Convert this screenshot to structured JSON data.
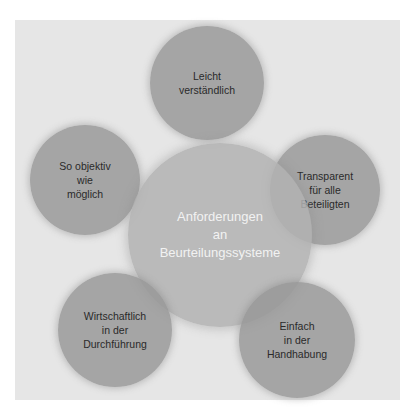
{
  "diagram": {
    "center": {
      "lines": "Anforderungen\nan\nBeurteilungssysteme"
    },
    "satellites": [
      {
        "id": "top",
        "lines": "Leicht\nverständlich"
      },
      {
        "id": "right",
        "lines": "Transparent\nfür alle\nBeteiligten"
      },
      {
        "id": "bottom-right",
        "lines": "Einfach\nin der\nHandhabung"
      },
      {
        "id": "bottom-left",
        "lines": "Wirtschaftlich\nin der\nDurchführung"
      },
      {
        "id": "left",
        "lines": "So objektiv\nwie\nmöglich"
      }
    ],
    "colors": {
      "background": "#e6e6e6",
      "satellite": "#969696",
      "center": "#b2b2b2",
      "satellite_text": "#2a2a2a",
      "center_text": "#f2f2f2"
    }
  }
}
